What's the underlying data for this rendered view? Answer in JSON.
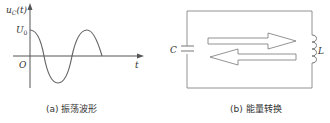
{
  "panel_a": {
    "y_label": "u_C(t)",
    "y_label_main": "u",
    "y_label_sub": "C",
    "y_label_arg": "(t)",
    "amplitude_label": "U",
    "amplitude_sub": "0",
    "origin_label": "O",
    "x_label": "t",
    "caption": "(a) 振荡波形"
  },
  "panel_b": {
    "capacitor_label": "C",
    "inductor_label": "L",
    "caption": "(b) 能量转换"
  },
  "colors": {
    "stroke": "#555555",
    "text": "#333333"
  }
}
